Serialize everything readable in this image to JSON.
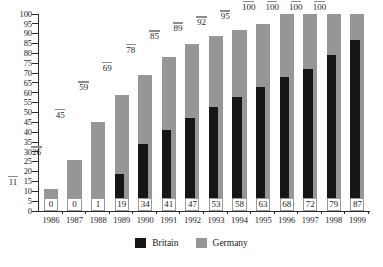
{
  "chart_data": {
    "type": "bar",
    "title": "",
    "subtitle": "",
    "xlabel": "",
    "ylabel": "",
    "ylim": [
      0,
      100
    ],
    "ytick_step": 5,
    "yticks": [
      0,
      5,
      10,
      15,
      20,
      25,
      30,
      35,
      40,
      45,
      50,
      55,
      60,
      65,
      70,
      75,
      80,
      85,
      90,
      95,
      100
    ],
    "grid": false,
    "legend_position": "bottom-center",
    "bar_mode": "overlap",
    "categories": [
      "1986",
      "1987",
      "1988",
      "1989",
      "1990",
      "1991",
      "1992",
      "1993",
      "1994",
      "1995",
      "1996",
      "1997",
      "1998",
      "1999"
    ],
    "series": [
      {
        "name": "Britain",
        "color": "#161616",
        "values": [
          0,
          0,
          1,
          19,
          34,
          41,
          47,
          53,
          58,
          63,
          68,
          72,
          79,
          87
        ]
      },
      {
        "name": "Germany",
        "color": "#969696",
        "values": [
          11,
          26,
          45,
          59,
          69,
          78,
          85,
          89,
          92,
          95,
          100,
          100,
          100,
          100
        ]
      }
    ]
  },
  "legend": {
    "items": [
      {
        "label": "Britain",
        "color": "#161616"
      },
      {
        "label": "Germany",
        "color": "#969696"
      }
    ]
  }
}
